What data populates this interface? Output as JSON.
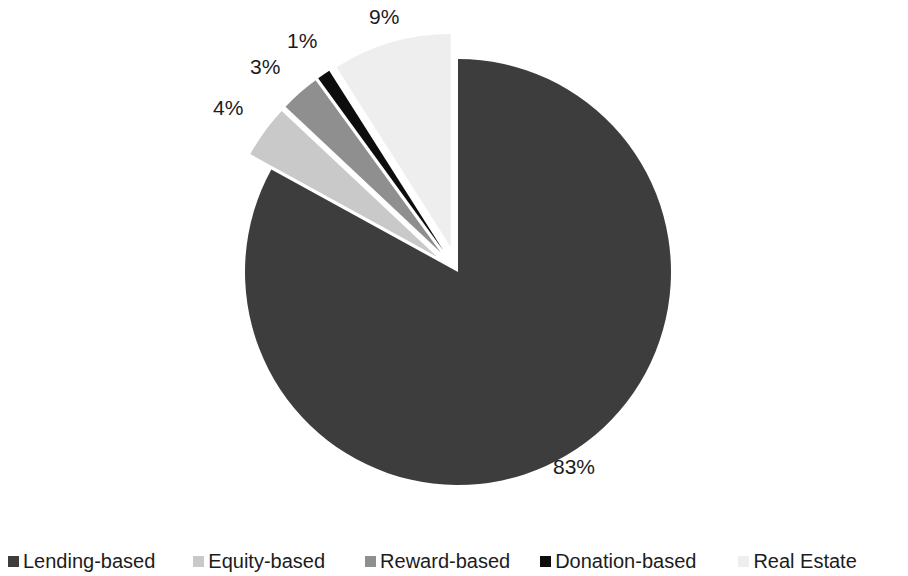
{
  "chart_data": {
    "type": "pie",
    "title": "",
    "subtitle": "",
    "categories": [
      "Lending-based",
      "Equity-based",
      "Reward-based",
      "Donation-based",
      "Real Estate"
    ],
    "values": [
      83,
      4,
      3,
      1,
      9
    ],
    "value_unit": "%",
    "data_labels": [
      "83%",
      "4%",
      "3%",
      "1%",
      "9%"
    ],
    "colors": [
      "#3d3d3d",
      "#c9c9c9",
      "#8f8f8f",
      "#0d0d0d",
      "#eeeeee"
    ],
    "legend_position": "bottom",
    "grid": false,
    "start_angle_deg": 0,
    "direction": "clockwise",
    "exploded_slices": [
      "Equity-based",
      "Reward-based",
      "Donation-based",
      "Real Estate"
    ],
    "series": [
      {
        "name": "Crowdfunding market share",
        "points": [
          {
            "label": "Lending-based",
            "value": 83,
            "display": "83%",
            "color": "#3d3d3d",
            "exploded": false
          },
          {
            "label": "Equity-based",
            "value": 4,
            "display": "4%",
            "color": "#c9c9c9",
            "exploded": true
          },
          {
            "label": "Reward-based",
            "value": 3,
            "display": "3%",
            "color": "#8f8f8f",
            "exploded": true
          },
          {
            "label": "Donation-based",
            "value": 1,
            "display": "1%",
            "color": "#0d0d0d",
            "exploded": true
          },
          {
            "label": "Real Estate",
            "value": 9,
            "display": "9%",
            "color": "#eeeeee",
            "exploded": true
          }
        ]
      }
    ]
  },
  "labels": {
    "lending": "83%",
    "equity": "4%",
    "reward": "3%",
    "donation": "1%",
    "real_estate": "9%"
  },
  "legend": {
    "items": [
      {
        "label": "Lending-based",
        "color": "#3d3d3d"
      },
      {
        "label": "Equity-based",
        "color": "#c9c9c9"
      },
      {
        "label": "Reward-based",
        "color": "#8f8f8f"
      },
      {
        "label": "Donation-based",
        "color": "#0d0d0d"
      },
      {
        "label": "Real Estate",
        "color": "#eeeeee"
      }
    ]
  }
}
